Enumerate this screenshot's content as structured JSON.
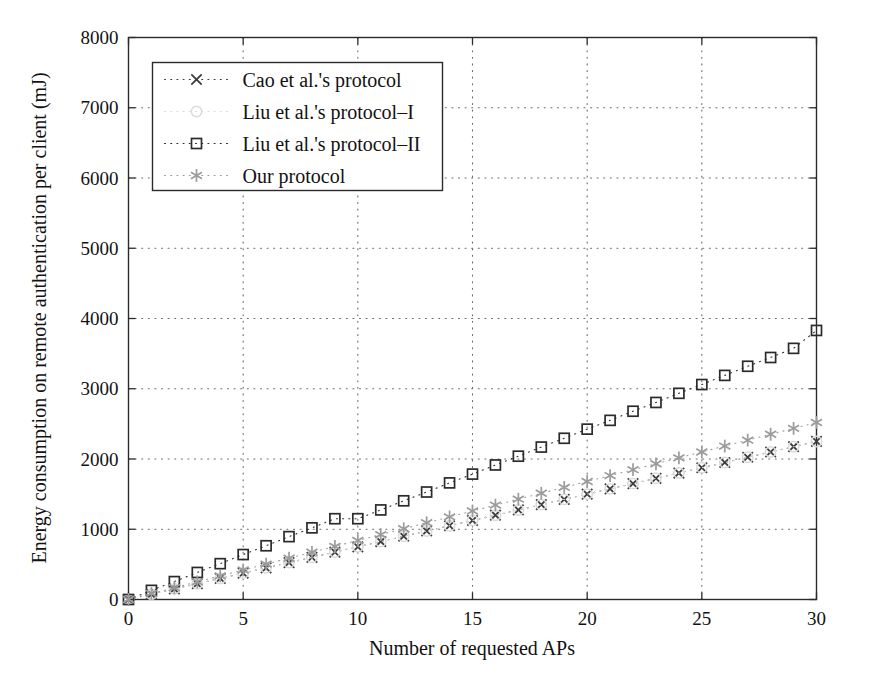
{
  "chart_data": {
    "type": "scatter",
    "title": "",
    "xlabel": "Number of requested APs",
    "ylabel": "Energy consumption on remote authentication per client (mJ)",
    "xlim": [
      0,
      30
    ],
    "ylim": [
      0,
      8000
    ],
    "xticks": [
      0,
      5,
      10,
      15,
      20,
      25,
      30
    ],
    "yticks": [
      0,
      1000,
      2000,
      3000,
      4000,
      5000,
      6000,
      7000,
      8000
    ],
    "xticklabels": [
      "0",
      "5",
      "10",
      "15",
      "20",
      "25",
      "30"
    ],
    "yticklabels": [
      "0",
      "1000",
      "2000",
      "3000",
      "4000",
      "5000",
      "6000",
      "7000",
      "8000"
    ],
    "grid": true,
    "grid_style": "dotted",
    "legend_position": "upper left",
    "x": [
      0,
      1,
      2,
      3,
      4,
      5,
      6,
      7,
      8,
      9,
      10,
      11,
      12,
      13,
      14,
      15,
      16,
      17,
      18,
      19,
      20,
      21,
      22,
      23,
      24,
      25,
      26,
      27,
      28,
      29,
      30
    ],
    "series": [
      {
        "name": "Cao et al.'s protocol",
        "marker": "x",
        "color": "#3c3c3c",
        "values": [
          0,
          75,
          150,
          225,
          300,
          375,
          450,
          525,
          600,
          675,
          750,
          825,
          900,
          975,
          1050,
          1125,
          1200,
          1275,
          1350,
          1425,
          1500,
          1575,
          1650,
          1725,
          1800,
          1875,
          1950,
          2025,
          2100,
          2175,
          2250
        ]
      },
      {
        "name": "Liu et al.'s protocol–I",
        "marker": "o",
        "color": "#dadada",
        "values": [
          0,
          75,
          150,
          225,
          300,
          375,
          450,
          525,
          600,
          675,
          750,
          825,
          900,
          975,
          1050,
          1125,
          1200,
          1275,
          1350,
          1425,
          1500,
          1575,
          1650,
          1725,
          1800,
          1875,
          1950,
          2025,
          2100,
          2175,
          2250
        ]
      },
      {
        "name": "Liu et al.'s protocol–II",
        "marker": "s",
        "color": "#2b2b2b",
        "values": [
          0,
          130,
          255,
          385,
          510,
          640,
          765,
          895,
          1020,
          1150,
          1150,
          1275,
          1405,
          1530,
          1660,
          1785,
          1915,
          2040,
          2170,
          2295,
          2425,
          2550,
          2680,
          2805,
          2935,
          3060,
          3190,
          3320,
          3445,
          3575,
          3830
        ]
      },
      {
        "name": "Our protocol",
        "marker": "*",
        "color": "#9b9b9b",
        "values": [
          0,
          85,
          168,
          252,
          336,
          420,
          504,
          588,
          672,
          756,
          840,
          924,
          1008,
          1092,
          1176,
          1260,
          1344,
          1428,
          1512,
          1596,
          1680,
          1764,
          1848,
          1932,
          2016,
          2100,
          2184,
          2268,
          2352,
          2436,
          2520
        ]
      }
    ]
  },
  "figure": {
    "background_color": "#ffffff",
    "axis_color": "#2b2b2b",
    "grid_color": "#6a6a6a"
  }
}
